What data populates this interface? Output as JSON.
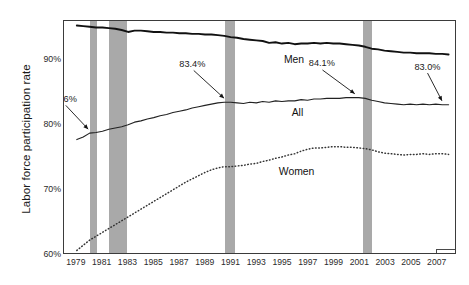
{
  "chart_data": {
    "type": "line",
    "title": "",
    "xlabel": "",
    "ylabel": "Labor force participation rate",
    "xlim": [
      1978.0,
      2008.5
    ],
    "ylim": [
      60,
      96
    ],
    "grid": false,
    "legend_position": "bottom-right",
    "ytick_labels": [
      "90%",
      "80%",
      "70%",
      "60%"
    ],
    "ytick_values": [
      90,
      80,
      70,
      60
    ],
    "xtick_labels": [
      "1979",
      "1981",
      "1983",
      "1985",
      "1987",
      "1989",
      "1991",
      "1993",
      "1995",
      "1997",
      "1999",
      "2001",
      "2003",
      "2005",
      "2007"
    ],
    "xtick_values": [
      1979,
      1981,
      1983,
      1985,
      1987,
      1989,
      1991,
      1993,
      1995,
      1997,
      1999,
      2001,
      2003,
      2005,
      2007
    ],
    "legend": [
      {
        "label": "Recessions",
        "color": "#a9a9a9",
        "swatch": "band"
      }
    ],
    "series": [
      {
        "name": "Men",
        "label": "Men",
        "style": "solid-thick",
        "color": "#111111",
        "x": [
          1979.0,
          1979.5,
          1980.0,
          1980.5,
          1981.0,
          1981.5,
          1982.0,
          1982.5,
          1983.0,
          1983.5,
          1984.0,
          1984.5,
          1985.0,
          1985.5,
          1986.0,
          1986.5,
          1987.0,
          1987.5,
          1988.0,
          1988.5,
          1989.0,
          1989.5,
          1990.0,
          1990.5,
          1991.0,
          1991.5,
          1992.0,
          1992.5,
          1993.0,
          1993.5,
          1994.0,
          1994.5,
          1995.0,
          1995.5,
          1996.0,
          1996.5,
          1997.0,
          1997.5,
          1998.0,
          1998.5,
          1999.0,
          1999.5,
          2000.0,
          2000.5,
          2001.0,
          2001.5,
          2002.0,
          2002.5,
          2003.0,
          2003.5,
          2004.0,
          2004.5,
          2005.0,
          2005.5,
          2006.0,
          2006.5,
          2007.0,
          2007.5,
          2008.0
        ],
        "y": [
          95.3,
          95.2,
          95.1,
          95.0,
          95.0,
          94.9,
          94.8,
          94.6,
          94.3,
          94.5,
          94.5,
          94.4,
          94.3,
          94.3,
          94.2,
          94.2,
          94.1,
          94.1,
          94.0,
          94.0,
          93.9,
          93.9,
          93.8,
          93.7,
          93.5,
          93.4,
          93.2,
          93.1,
          93.0,
          92.9,
          92.6,
          92.7,
          92.5,
          92.6,
          92.4,
          92.5,
          92.5,
          92.6,
          92.5,
          92.6,
          92.5,
          92.5,
          92.4,
          92.3,
          92.2,
          92.0,
          91.7,
          91.6,
          91.4,
          91.3,
          91.2,
          91.1,
          91.1,
          91.0,
          91.0,
          91.0,
          90.9,
          90.9,
          90.8
        ]
      },
      {
        "name": "All",
        "label": "All",
        "style": "solid-thin",
        "color": "#222222",
        "x": [
          1979.0,
          1979.5,
          1980.0,
          1980.5,
          1981.0,
          1981.5,
          1982.0,
          1982.5,
          1983.0,
          1983.5,
          1984.0,
          1984.5,
          1985.0,
          1985.5,
          1986.0,
          1986.5,
          1987.0,
          1987.5,
          1988.0,
          1988.5,
          1989.0,
          1989.5,
          1990.0,
          1990.5,
          1991.0,
          1991.5,
          1992.0,
          1992.5,
          1993.0,
          1993.5,
          1994.0,
          1994.5,
          1995.0,
          1995.5,
          1996.0,
          1996.5,
          1997.0,
          1997.5,
          1998.0,
          1998.5,
          1999.0,
          1999.5,
          2000.0,
          2000.5,
          2001.0,
          2001.5,
          2002.0,
          2002.5,
          2003.0,
          2003.5,
          2004.0,
          2004.5,
          2005.0,
          2005.5,
          2006.0,
          2006.5,
          2007.0,
          2007.5,
          2008.0
        ],
        "y": [
          77.6,
          78.0,
          78.6,
          78.7,
          78.9,
          79.2,
          79.4,
          79.6,
          79.9,
          80.3,
          80.5,
          80.8,
          81.0,
          81.3,
          81.5,
          81.8,
          82.0,
          82.2,
          82.5,
          82.7,
          82.9,
          83.1,
          83.3,
          83.4,
          83.4,
          83.3,
          83.2,
          83.4,
          83.3,
          83.5,
          83.4,
          83.6,
          83.5,
          83.6,
          83.6,
          83.8,
          83.7,
          83.9,
          83.9,
          84.0,
          84.0,
          84.0,
          84.1,
          84.1,
          84.1,
          84.0,
          83.7,
          83.5,
          83.3,
          83.2,
          83.1,
          83.0,
          83.1,
          83.0,
          83.1,
          83.0,
          83.1,
          83.0,
          83.0
        ]
      },
      {
        "name": "Women",
        "label": "Women",
        "style": "dotted",
        "color": "#333333",
        "x": [
          1979.0,
          1979.5,
          1980.0,
          1980.5,
          1981.0,
          1981.5,
          1982.0,
          1982.5,
          1983.0,
          1983.5,
          1984.0,
          1984.5,
          1985.0,
          1985.5,
          1986.0,
          1986.5,
          1987.0,
          1987.5,
          1988.0,
          1988.5,
          1989.0,
          1989.5,
          1990.0,
          1990.5,
          1991.0,
          1991.5,
          1992.0,
          1992.5,
          1993.0,
          1993.5,
          1994.0,
          1994.5,
          1995.0,
          1995.5,
          1996.0,
          1996.5,
          1997.0,
          1997.5,
          1998.0,
          1998.5,
          1999.0,
          1999.5,
          2000.0,
          2000.5,
          2001.0,
          2001.5,
          2002.0,
          2002.5,
          2003.0,
          2003.5,
          2004.0,
          2004.5,
          2005.0,
          2005.5,
          2006.0,
          2006.5,
          2007.0,
          2007.5,
          2008.0
        ],
        "y": [
          60.4,
          61.2,
          62.0,
          62.6,
          63.2,
          63.8,
          64.4,
          65.0,
          65.6,
          66.2,
          66.8,
          67.4,
          68.0,
          68.6,
          69.2,
          69.8,
          70.4,
          71.0,
          71.5,
          72.0,
          72.5,
          72.9,
          73.2,
          73.4,
          73.4,
          73.5,
          73.6,
          73.8,
          73.9,
          74.2,
          74.4,
          74.7,
          74.9,
          75.2,
          75.4,
          75.8,
          76.1,
          76.3,
          76.3,
          76.4,
          76.5,
          76.5,
          76.4,
          76.4,
          76.3,
          76.2,
          76.0,
          75.7,
          75.5,
          75.4,
          75.3,
          75.2,
          75.3,
          75.3,
          75.4,
          75.3,
          75.4,
          75.4,
          75.3
        ]
      }
    ],
    "recessions": [
      {
        "start": 1980.0,
        "end": 1980.6
      },
      {
        "start": 1981.5,
        "end": 1982.9
      },
      {
        "start": 1990.5,
        "end": 1991.3
      },
      {
        "start": 2001.2,
        "end": 2001.9
      }
    ],
    "annotations": [
      {
        "text": "78.6%",
        "series": "All",
        "x": 1980.0,
        "y": 78.6
      },
      {
        "text": "83.4%",
        "series": "All",
        "x": 1990.6,
        "y": 83.4
      },
      {
        "text": "84.1%",
        "series": "All",
        "x": 2000.8,
        "y": 84.1
      },
      {
        "text": "83.0%",
        "series": "All",
        "x": 2007.6,
        "y": 83.0
      }
    ],
    "series_labels": [
      {
        "text": "Men",
        "x": 1996.0,
        "y": 89.9
      },
      {
        "text": "All",
        "x": 1996.6,
        "y": 81.7
      },
      {
        "text": "Women",
        "x": 1995.6,
        "y": 72.6
      }
    ]
  }
}
